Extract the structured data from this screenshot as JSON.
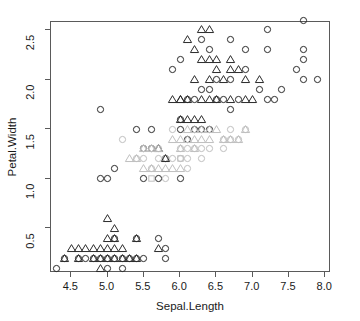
{
  "chart_data": {
    "type": "scatter",
    "title": "",
    "xlabel": "Sepal.Length",
    "ylabel": "Petal.Width",
    "xlim": [
      4.22,
      8.08
    ],
    "ylim": [
      0.05,
      2.58
    ],
    "xticks": [
      4.5,
      5.0,
      5.5,
      6.0,
      6.5,
      7.0,
      7.5,
      8.0
    ],
    "xticklabels": [
      "4.5",
      "5.0",
      "5.5",
      "6.0",
      "6.5",
      "7.0",
      "7.5",
      "8.0"
    ],
    "yticks": [
      0.5,
      1.0,
      1.5,
      2.0,
      2.5
    ],
    "yticklabels": [
      "0.5",
      "1.0",
      "1.5",
      "2.0",
      "2.5"
    ],
    "grid": false,
    "legend": "none",
    "frame": true,
    "marker_shapes": [
      "circle",
      "triangle",
      "square"
    ],
    "marker_colors": {
      "dark": "#2b2b2b",
      "mid": "#8c8c8c",
      "light": "#bfbfbf"
    },
    "series": [
      {
        "name": "circle-dark",
        "shape": "circle",
        "color": "#2b2b2b",
        "points": [
          [
            4.3,
            0.1
          ],
          [
            4.4,
            0.2
          ],
          [
            4.6,
            0.2
          ],
          [
            4.7,
            0.2
          ],
          [
            4.8,
            0.2
          ],
          [
            4.9,
            0.2
          ],
          [
            5.0,
            0.2
          ],
          [
            5.1,
            0.2
          ],
          [
            5.2,
            0.2
          ],
          [
            5.3,
            0.2
          ],
          [
            5.4,
            0.2
          ],
          [
            5.5,
            0.2
          ],
          [
            5.0,
            0.1
          ],
          [
            5.2,
            0.1
          ],
          [
            5.8,
            0.2
          ],
          [
            5.7,
            0.4
          ],
          [
            5.4,
            0.4
          ],
          [
            5.1,
            0.4
          ],
          [
            5.8,
            0.3
          ],
          [
            4.9,
            1.0
          ],
          [
            5.0,
            1.0
          ],
          [
            5.1,
            1.1
          ],
          [
            5.5,
            1.0
          ],
          [
            5.7,
            1.0
          ],
          [
            5.6,
            1.3
          ],
          [
            5.5,
            1.3
          ],
          [
            5.8,
            1.2
          ],
          [
            6.0,
            1.0
          ],
          [
            4.9,
            1.7
          ],
          [
            5.6,
            1.5
          ],
          [
            5.4,
            1.5
          ],
          [
            6.0,
            1.5
          ],
          [
            6.1,
            1.4
          ],
          [
            6.2,
            1.5
          ],
          [
            6.3,
            1.5
          ],
          [
            6.4,
            1.5
          ],
          [
            6.0,
            1.6
          ],
          [
            6.2,
            1.8
          ],
          [
            6.1,
            1.8
          ],
          [
            5.9,
            2.1
          ],
          [
            6.0,
            2.2
          ],
          [
            6.3,
            2.4
          ],
          [
            6.4,
            2.3
          ],
          [
            6.5,
            2.0
          ],
          [
            6.7,
            2.0
          ],
          [
            6.9,
            2.1
          ],
          [
            7.2,
            2.5
          ],
          [
            7.6,
            2.1
          ],
          [
            7.7,
            2.2
          ],
          [
            7.7,
            2.3
          ],
          [
            7.9,
            2.0
          ],
          [
            7.7,
            2.0
          ],
          [
            7.1,
            1.9
          ],
          [
            7.4,
            1.9
          ],
          [
            7.3,
            1.8
          ],
          [
            7.2,
            1.8
          ],
          [
            6.8,
            1.8
          ],
          [
            6.5,
            1.8
          ],
          [
            6.6,
            1.8
          ],
          [
            6.7,
            1.7
          ],
          [
            6.4,
            1.9
          ],
          [
            6.3,
            1.9
          ],
          [
            6.7,
            2.4
          ],
          [
            6.9,
            2.3
          ],
          [
            7.2,
            2.3
          ],
          [
            7.7,
            2.6
          ]
        ]
      },
      {
        "name": "circle-light",
        "shape": "circle",
        "color": "#bfbfbf",
        "points": [
          [
            5.5,
            1.3
          ],
          [
            5.6,
            1.3
          ],
          [
            5.7,
            1.3
          ],
          [
            5.8,
            1.2
          ],
          [
            5.9,
            1.5
          ],
          [
            5.6,
            1.1
          ],
          [
            5.7,
            1.2
          ],
          [
            5.8,
            1.0
          ],
          [
            6.0,
            1.3
          ],
          [
            6.1,
            1.3
          ],
          [
            6.2,
            1.3
          ],
          [
            6.3,
            1.3
          ],
          [
            6.4,
            1.3
          ],
          [
            6.6,
            1.3
          ],
          [
            6.7,
            1.4
          ],
          [
            6.1,
            1.2
          ],
          [
            6.0,
            1.2
          ],
          [
            5.9,
            1.2
          ],
          [
            6.3,
            1.2
          ],
          [
            5.5,
            1.2
          ],
          [
            5.4,
            1.2
          ],
          [
            5.2,
            1.4
          ],
          [
            6.6,
            1.4
          ],
          [
            6.8,
            1.4
          ],
          [
            6.9,
            1.5
          ],
          [
            6.7,
            1.5
          ],
          [
            6.1,
            1.1
          ]
        ]
      },
      {
        "name": "triangle-dark",
        "shape": "triangle",
        "color": "#2b2b2b",
        "points": [
          [
            4.4,
            0.2
          ],
          [
            4.6,
            0.3
          ],
          [
            4.8,
            0.2
          ],
          [
            4.9,
            0.2
          ],
          [
            5.0,
            0.3
          ],
          [
            5.1,
            0.3
          ],
          [
            5.2,
            0.2
          ],
          [
            5.4,
            0.2
          ],
          [
            5.1,
            0.4
          ],
          [
            5.0,
            0.4
          ],
          [
            5.1,
            0.5
          ],
          [
            5.0,
            0.6
          ],
          [
            4.9,
            0.3
          ],
          [
            4.7,
            0.3
          ],
          [
            4.6,
            0.2
          ],
          [
            4.8,
            0.3
          ],
          [
            5.3,
            0.2
          ],
          [
            5.2,
            0.3
          ],
          [
            4.5,
            0.3
          ],
          [
            5.4,
            0.4
          ],
          [
            5.7,
            0.3
          ],
          [
            5.1,
            0.2
          ],
          [
            5.0,
            0.2
          ],
          [
            4.9,
            0.1
          ],
          [
            5.8,
            1.2
          ],
          [
            5.7,
            1.3
          ],
          [
            6.0,
            1.6
          ],
          [
            6.1,
            1.6
          ],
          [
            6.3,
            1.6
          ],
          [
            6.2,
            1.6
          ],
          [
            6.0,
            1.8
          ],
          [
            6.1,
            1.8
          ],
          [
            6.3,
            1.8
          ],
          [
            6.4,
            1.8
          ],
          [
            6.5,
            1.8
          ],
          [
            6.2,
            2.0
          ],
          [
            6.4,
            2.0
          ],
          [
            6.5,
            2.1
          ],
          [
            6.7,
            2.1
          ],
          [
            6.8,
            2.1
          ],
          [
            6.3,
            2.2
          ],
          [
            6.4,
            2.2
          ],
          [
            6.5,
            2.2
          ],
          [
            6.7,
            2.2
          ],
          [
            6.3,
            2.5
          ],
          [
            6.4,
            2.5
          ],
          [
            6.2,
            2.3
          ],
          [
            6.1,
            2.4
          ],
          [
            5.9,
            1.8
          ],
          [
            6.0,
            1.8
          ],
          [
            6.7,
            1.8
          ],
          [
            6.9,
            1.8
          ],
          [
            7.0,
            1.8
          ],
          [
            6.6,
            2.0
          ],
          [
            6.9,
            2.0
          ],
          [
            7.1,
            2.0
          ]
        ]
      },
      {
        "name": "triangle-light",
        "shape": "triangle",
        "color": "#bfbfbf",
        "points": [
          [
            5.5,
            1.3
          ],
          [
            5.6,
            1.3
          ],
          [
            5.7,
            1.3
          ],
          [
            5.9,
            1.4
          ],
          [
            6.0,
            1.4
          ],
          [
            6.1,
            1.4
          ],
          [
            6.2,
            1.4
          ],
          [
            6.3,
            1.4
          ],
          [
            6.4,
            1.4
          ],
          [
            6.6,
            1.4
          ],
          [
            6.7,
            1.4
          ],
          [
            6.8,
            1.4
          ],
          [
            5.8,
            1.1
          ],
          [
            5.9,
            1.1
          ],
          [
            6.0,
            1.1
          ],
          [
            5.5,
            1.1
          ],
          [
            5.6,
            1.1
          ],
          [
            5.7,
            1.1
          ],
          [
            6.1,
            1.5
          ],
          [
            6.2,
            1.5
          ],
          [
            6.3,
            1.5
          ],
          [
            6.5,
            1.5
          ],
          [
            6.4,
            1.5
          ],
          [
            5.4,
            1.2
          ],
          [
            5.3,
            1.2
          ],
          [
            6.9,
            1.5
          ],
          [
            6.0,
            1.3
          ],
          [
            6.2,
            1.3
          ]
        ]
      },
      {
        "name": "square-light",
        "shape": "square",
        "color": "#bfbfbf",
        "points": [
          [
            6.0,
            1.2
          ],
          [
            5.6,
            1.0
          ]
        ]
      }
    ]
  },
  "axis": {
    "x_title": "Sepal.Length",
    "y_title": "Petal.Width"
  }
}
